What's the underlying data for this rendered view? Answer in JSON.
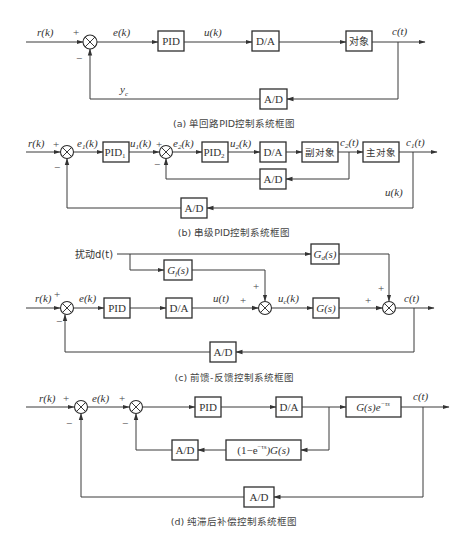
{
  "diagrams": {
    "a": {
      "caption": "(a) 单回路PID控制系统框图",
      "input": "r(k)",
      "error": "e(k)",
      "control": "u(k)",
      "output": "c(t)",
      "feedback": "y",
      "feedback_sub": "c",
      "plus": "+",
      "minus": "−",
      "blocks": {
        "pid": "PID",
        "da": "D/A",
        "plant": "对象",
        "ad": "A/D"
      }
    },
    "b": {
      "caption": "(b) 串级PID控制系统框图",
      "input": "r(k)",
      "e1": "e",
      "e1_sub": "1",
      "e2": "e",
      "e2_sub": "2",
      "u1": "u",
      "u1_sub": "1",
      "u2": "u",
      "u2_sub": "2",
      "c2": "c",
      "c2_sub": "2",
      "c1": "c",
      "c1_sub": "1",
      "arg_k": "(k)",
      "arg_t": "(t)",
      "outer_feedback": "u(k)",
      "plus": "+",
      "minus": "−",
      "blocks": {
        "pid1": "PID",
        "pid1_sub": "1",
        "pid2": "PID",
        "pid2_sub": "2",
        "da": "D/A",
        "secondary": "副对象",
        "primary": "主对象",
        "ad_inner": "A/D",
        "ad_outer": "A/D"
      }
    },
    "c": {
      "caption": "(c) 前馈-反馈控制系统框图",
      "disturbance": "扰动d(t)",
      "input": "r(k)",
      "error": "e(k)",
      "control": "u(t)",
      "uc": "u",
      "uc_sub": "c",
      "uc_arg": "(k)",
      "output": "c(t)",
      "plus": "+",
      "minus": "−",
      "blocks": {
        "gf": "G",
        "gf_sub": "f",
        "gd": "G",
        "gd_sub": "d",
        "s_arg": "(s)",
        "pid": "PID",
        "da": "D/A",
        "gs": "G(s)",
        "ad": "A/D"
      }
    },
    "d": {
      "caption": "(d) 纯滞后补偿控制系统框图",
      "input": "r(k)",
      "error": "e(k)",
      "output": "c(t)",
      "plus": "+",
      "minus": "−",
      "blocks": {
        "pid": "PID",
        "da": "D/A",
        "plant": "G(s)e",
        "plant_exp": "−τs",
        "comp_pre": "(1−e",
        "comp_exp": "−τs",
        "comp_post": ")G(s)",
        "ad_inner": "A/D",
        "ad_outer": "A/D"
      }
    }
  }
}
